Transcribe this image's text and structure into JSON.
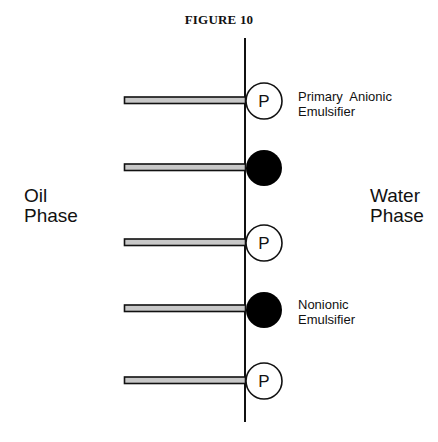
{
  "figure": {
    "title": "FIGURE 10",
    "left_phase": [
      "Oil",
      "Phase"
    ],
    "right_phase": [
      "Water",
      "Phase"
    ],
    "callouts": {
      "primary": [
        "Primary  Anionic",
        "Emulsifier"
      ],
      "nonionic": [
        "Nonionic",
        "Emulsifier"
      ]
    },
    "head_label": "P",
    "molecules": [
      {
        "type": "primary-anionic",
        "head": "open",
        "label": "P",
        "y": 100
      },
      {
        "type": "nonionic",
        "head": "filled",
        "label": "",
        "y": 167
      },
      {
        "type": "primary-anionic",
        "head": "open",
        "label": "P",
        "y": 242
      },
      {
        "type": "nonionic",
        "head": "filled",
        "label": "",
        "y": 308
      },
      {
        "type": "primary-anionic",
        "head": "open",
        "label": "P",
        "y": 380
      }
    ],
    "colors": {
      "line": "#111111",
      "tail_fill": "#c8c8c8",
      "head_filled": "#000000",
      "head_open": "#ffffff"
    }
  }
}
